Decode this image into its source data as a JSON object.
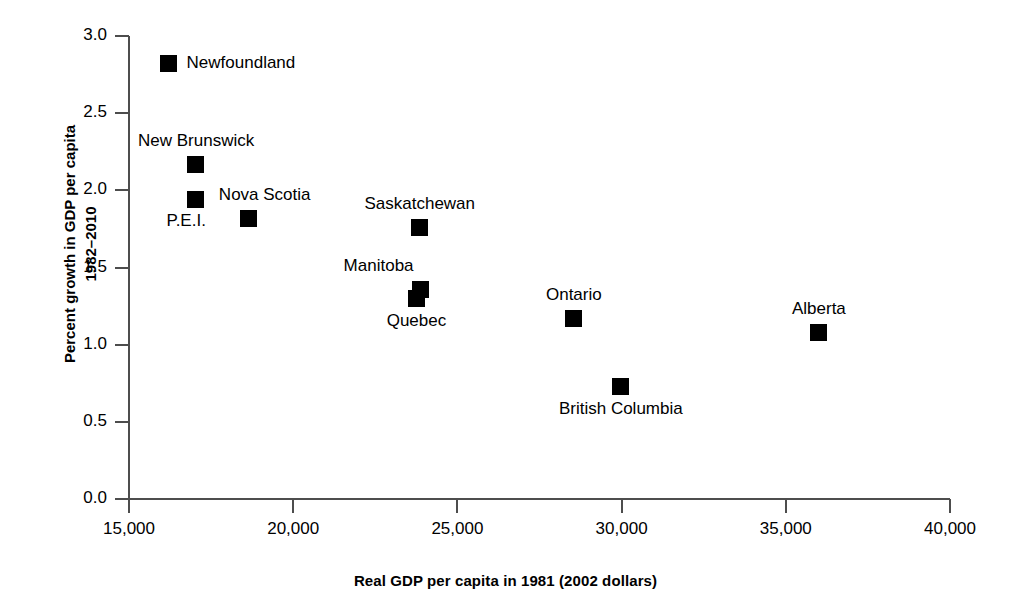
{
  "chart_data": {
    "type": "scatter",
    "title": "",
    "xlabel": "Real GDP per capita in 1981 (2002 dollars)",
    "ylabel": "Percent growth in GDP per capita 1982–2010",
    "ylabel_lines": [
      "Percent growth in GDP per capita",
      "1982–2010"
    ],
    "xlim": [
      15000,
      40000
    ],
    "ylim": [
      0.0,
      3.0
    ],
    "xticks": [
      15000,
      20000,
      25000,
      30000,
      35000,
      40000
    ],
    "xtick_labels": [
      "15,000",
      "20,000",
      "25,000",
      "30,000",
      "35,000",
      "40,000"
    ],
    "yticks": [
      0.0,
      0.5,
      1.0,
      1.5,
      2.0,
      2.5,
      3.0
    ],
    "ytick_labels": [
      "0.0",
      "0.5",
      "1.0",
      "1.5",
      "2.0",
      "2.5",
      "3.0"
    ],
    "grid": false,
    "legend": "none",
    "marker": "square",
    "marker_color": "#000000",
    "points": [
      {
        "name": "Newfoundland",
        "x": 16190,
        "y": 2.82,
        "label_dx": 16,
        "label_dy": 0,
        "label_anchor": "left"
      },
      {
        "name": "New Brunswick",
        "x": 17040,
        "y": 2.17,
        "label_dx": 0,
        "label_dy": -22,
        "label_anchor": "center"
      },
      {
        "name": "P.E.I.",
        "x": 17040,
        "y": 1.94,
        "label_dx": -10,
        "label_dy": 22,
        "label_anchor": "center"
      },
      {
        "name": "Nova Scotia",
        "x": 18650,
        "y": 1.82,
        "label_dx": 16,
        "label_dy": -22,
        "label_anchor": "center"
      },
      {
        "name": "Saskatchewan",
        "x": 23860,
        "y": 1.76,
        "label_dx": 0,
        "label_dy": -22,
        "label_anchor": "center"
      },
      {
        "name": "Manitoba",
        "x": 23880,
        "y": 1.36,
        "label_dx": -42,
        "label_dy": -22,
        "label_anchor": "center"
      },
      {
        "name": "Quebec",
        "x": 23760,
        "y": 1.3,
        "label_dx": 0,
        "label_dy": 24,
        "label_anchor": "center"
      },
      {
        "name": "Ontario",
        "x": 28550,
        "y": 1.17,
        "label_dx": 0,
        "label_dy": -22,
        "label_anchor": "center"
      },
      {
        "name": "British Columbia",
        "x": 29980,
        "y": 0.73,
        "label_dx": 0,
        "label_dy": 24,
        "label_anchor": "center"
      },
      {
        "name": "Alberta",
        "x": 36010,
        "y": 1.08,
        "label_dx": 0,
        "label_dy": -22,
        "label_anchor": "center"
      }
    ]
  },
  "axes": {
    "x_title": "Real GDP per capita in 1981 (2002 dollars)",
    "y_title_line1": "Percent growth in GDP per capita",
    "y_title_line2": "1982–2010"
  },
  "colors": {
    "marker": "#000000",
    "axis": "#4d4d4d",
    "text": "#000000",
    "background": "#ffffff"
  }
}
